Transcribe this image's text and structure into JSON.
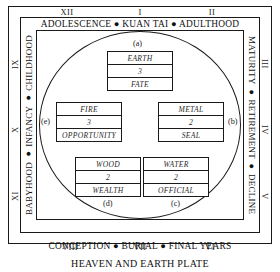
{
  "caption": "HEAVEN AND EARTH PLATE",
  "bands": {
    "top": "ADOLESCENCE ● KUAN TAI ● ADULTHOOD",
    "bottom": "CONCEPTION ● BURIAL ● FINAL YEARS",
    "left": "BABYHOOD ● INFANCY ● CHILDHOOD",
    "right": "MATURITY ● RETIREMENT ● DECLINE"
  },
  "numerals": {
    "top": [
      "XII",
      "I",
      "II"
    ],
    "right": [
      "III",
      "IV",
      "V"
    ],
    "bottom": [
      "VIII",
      "VII",
      "VI"
    ],
    "left": [
      "XI",
      "X",
      "IX"
    ]
  },
  "callouts": {
    "a": "(a)",
    "b": "(b)",
    "c": "(c)",
    "d": "(d)",
    "e": "(e)"
  },
  "boxes": {
    "a": {
      "element": "EARTH",
      "number": "3",
      "meaning": "FATE"
    },
    "b": {
      "element": "METAL",
      "number": "2",
      "meaning": "SEAL"
    },
    "c": {
      "element": "WATER",
      "number": "2",
      "meaning": "OFFICIAL"
    },
    "d": {
      "element": "WOOD",
      "number": "2",
      "meaning": "WEALTH"
    },
    "e": {
      "element": "FIRE",
      "number": "3",
      "meaning": "OPPORTUNITY"
    }
  },
  "colors": {
    "ink": "#1a1a1a",
    "paper": "#ffffff"
  }
}
